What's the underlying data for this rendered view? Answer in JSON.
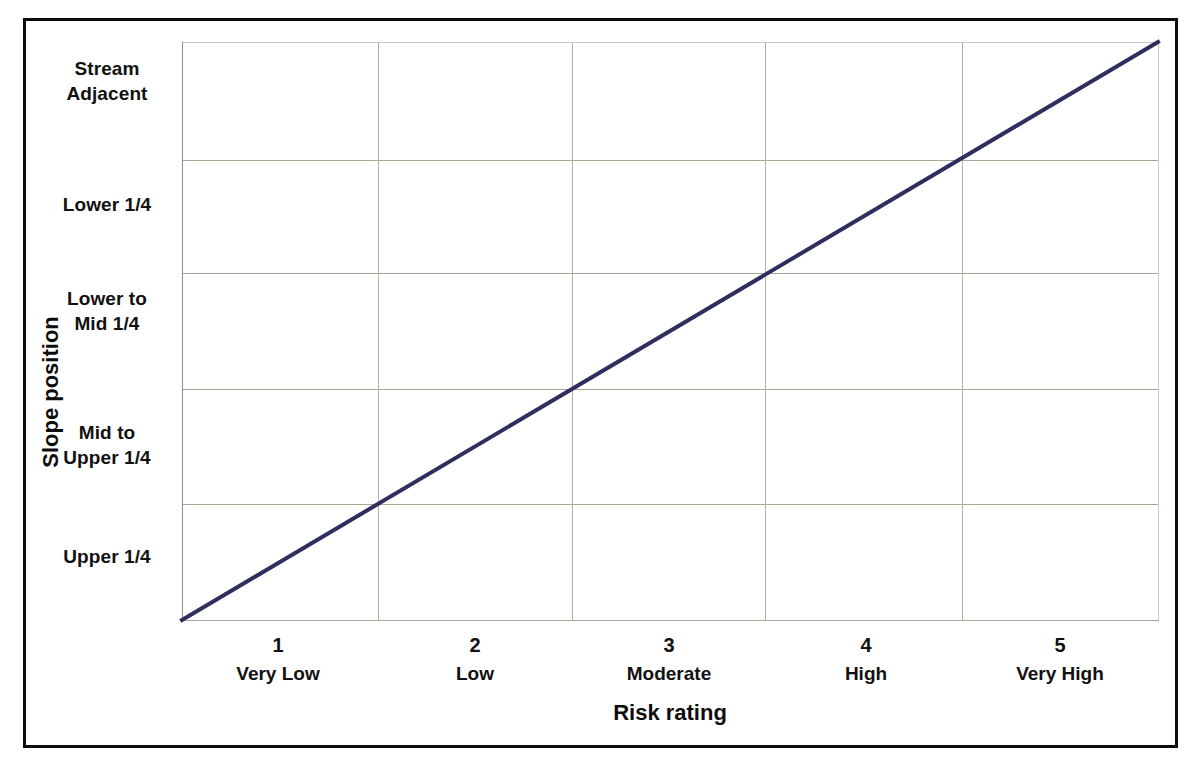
{
  "chart_data": {
    "type": "line",
    "title": "",
    "xlabel": "Risk rating",
    "ylabel": "Slope position",
    "grid": true,
    "legend": false,
    "line_color": "#2e2f5e",
    "gridline_color": "#a8a793",
    "frame_color": "#0c0c0c",
    "background": "#ffffff",
    "x": [
      1,
      2,
      3,
      4,
      5
    ],
    "xlim": [
      0.5,
      5.5
    ],
    "ylim": [
      0.5,
      5.5
    ],
    "x_tick_numbers": [
      "1",
      "2",
      "3",
      "4",
      "5"
    ],
    "x_tick_names": [
      "Very Low",
      "Low",
      "Moderate",
      "High",
      "Very High"
    ],
    "y_categories": [
      "Upper 1/4",
      "Mid to\nUpper 1/4",
      "Lower to\nMid 1/4",
      "Lower 1/4",
      "Stream\nAdjacent"
    ],
    "series": [
      {
        "name": "Risk vs slope position",
        "values": [
          1,
          2,
          3,
          4,
          5
        ],
        "points": [
          {
            "x": 0.5,
            "y": 0.5
          },
          {
            "x": 5.5,
            "y": 5.5
          }
        ]
      }
    ],
    "annotations": []
  },
  "axes": {
    "y_labels": [
      {
        "line1": "Stream",
        "line2": "Adjacent"
      },
      {
        "line1": "Lower 1/4",
        "line2": ""
      },
      {
        "line1": "Lower to",
        "line2": "Mid 1/4"
      },
      {
        "line1": "Mid to",
        "line2": "Upper 1/4"
      },
      {
        "line1": "Upper 1/4",
        "line2": ""
      }
    ],
    "x_labels": [
      {
        "num": "1",
        "name": "Very Low"
      },
      {
        "num": "2",
        "name": "Low"
      },
      {
        "num": "3",
        "name": "Moderate"
      },
      {
        "num": "4",
        "name": "High"
      },
      {
        "num": "5",
        "name": "Very High"
      }
    ],
    "x_title": "Risk rating",
    "y_title": "Slope position"
  }
}
